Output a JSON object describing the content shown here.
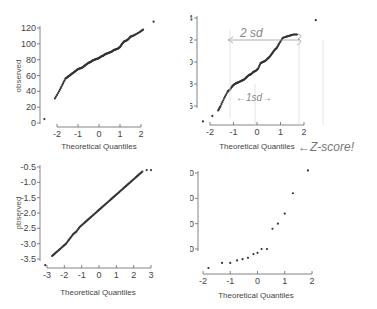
{
  "chart_data": [
    {
      "type": "scatter",
      "panel": "top-left",
      "title": "",
      "xlabel": "Theoretical Quantiles",
      "ylabel": "observed",
      "xticks": [
        "-2",
        "-1",
        "0",
        "1",
        "2"
      ],
      "yticks": [
        "0",
        "20",
        "40",
        "60",
        "80",
        "100",
        "120"
      ],
      "xlim": [
        -2.4,
        2.4
      ],
      "ylim": [
        0,
        120
      ],
      "description": "Q-Q plot, left-skew tail: a few low outliers, then linear body",
      "points": [
        [
          -2.6,
          5
        ],
        [
          -2.1,
          31
        ],
        [
          -1.9,
          40
        ],
        [
          -1.75,
          48
        ],
        [
          -1.6,
          56
        ],
        [
          -1.5,
          58
        ],
        [
          -1.4,
          60
        ],
        [
          -1.3,
          62
        ],
        [
          -1.2,
          64
        ],
        [
          -1.1,
          66
        ],
        [
          -1.0,
          68
        ],
        [
          -0.9,
          69
        ],
        [
          -0.8,
          70
        ],
        [
          -0.7,
          72
        ],
        [
          -0.6,
          74
        ],
        [
          -0.5,
          76
        ],
        [
          -0.4,
          77
        ],
        [
          -0.3,
          79
        ],
        [
          -0.2,
          80
        ],
        [
          -0.1,
          81
        ],
        [
          0.0,
          82
        ],
        [
          0.1,
          84
        ],
        [
          0.2,
          85
        ],
        [
          0.3,
          87
        ],
        [
          0.4,
          88
        ],
        [
          0.5,
          89
        ],
        [
          0.6,
          90
        ],
        [
          0.7,
          92
        ],
        [
          0.8,
          93
        ],
        [
          0.9,
          94
        ],
        [
          1.0,
          96
        ],
        [
          1.1,
          100
        ],
        [
          1.2,
          103
        ],
        [
          1.3,
          104
        ],
        [
          1.4,
          106
        ],
        [
          1.5,
          109
        ],
        [
          1.6,
          110
        ],
        [
          1.75,
          112
        ],
        [
          1.95,
          115
        ],
        [
          2.1,
          118
        ],
        [
          2.6,
          128
        ]
      ]
    },
    {
      "type": "scatter",
      "panel": "top-right",
      "title": "",
      "xlabel": "Theoretical Quantiles",
      "ylabel": "observed",
      "xticks": [
        "-2",
        "-1",
        "0",
        "1",
        "2"
      ],
      "yticks": [
        "6",
        "8",
        "10",
        "12",
        "14"
      ],
      "xlim": [
        -2.2,
        2.2
      ],
      "ylim": [
        5,
        14
      ],
      "annotations": [
        "2 sd",
        "1sd",
        "Z-score!"
      ],
      "points": [
        [
          -2.3,
          4.6
        ],
        [
          -1.9,
          5.1
        ],
        [
          -1.65,
          5.6
        ],
        [
          -1.55,
          6.0
        ],
        [
          -1.4,
          6.7
        ],
        [
          -1.25,
          7.3
        ],
        [
          -1.15,
          7.5
        ],
        [
          -1.05,
          7.8
        ],
        [
          -0.95,
          8.0
        ],
        [
          -0.85,
          8.1
        ],
        [
          -0.75,
          8.2
        ],
        [
          -0.65,
          8.3
        ],
        [
          -0.55,
          8.4
        ],
        [
          -0.45,
          8.6
        ],
        [
          -0.35,
          8.8
        ],
        [
          -0.25,
          8.9
        ],
        [
          -0.15,
          9.1
        ],
        [
          -0.05,
          9.2
        ],
        [
          0.05,
          9.4
        ],
        [
          0.15,
          9.9
        ],
        [
          0.25,
          10.0
        ],
        [
          0.35,
          10.1
        ],
        [
          0.45,
          10.3
        ],
        [
          0.55,
          10.5
        ],
        [
          0.65,
          10.8
        ],
        [
          0.75,
          11.1
        ],
        [
          0.85,
          11.3
        ],
        [
          0.95,
          11.7
        ],
        [
          1.1,
          12.2
        ],
        [
          1.25,
          12.3
        ],
        [
          1.4,
          12.4
        ],
        [
          1.55,
          12.5
        ],
        [
          1.7,
          12.5
        ],
        [
          2.5,
          13.8
        ]
      ]
    },
    {
      "type": "scatter",
      "panel": "bottom-left",
      "title": "",
      "xlabel": "Theoretical Quantiles",
      "ylabel": "observed",
      "xticks": [
        "-3",
        "-2",
        "-1",
        "0",
        "1",
        "2",
        "3"
      ],
      "yticks": [
        "-3.5",
        "-3.0",
        "-2.5",
        "-2.0",
        "-1.5",
        "-1.0",
        "-0.5"
      ],
      "xlim": [
        -3.2,
        3.2
      ],
      "ylim": [
        -3.5,
        -0.5
      ],
      "description": "Q-Q plot, nearly perfectly linear",
      "points": [
        [
          -3.1,
          -3.7
        ],
        [
          -2.7,
          -3.4
        ],
        [
          -2.5,
          -3.3
        ],
        [
          -2.3,
          -3.2
        ],
        [
          -2.1,
          -3.1
        ],
        [
          -1.9,
          -3.0
        ],
        [
          -1.7,
          -2.85
        ],
        [
          -1.5,
          -2.7
        ],
        [
          -1.3,
          -2.6
        ],
        [
          -1.1,
          -2.45
        ],
        [
          -0.9,
          -2.35
        ],
        [
          -0.7,
          -2.25
        ],
        [
          -0.5,
          -2.15
        ],
        [
          -0.3,
          -2.05
        ],
        [
          -0.1,
          -1.95
        ],
        [
          0.1,
          -1.85
        ],
        [
          0.3,
          -1.75
        ],
        [
          0.5,
          -1.65
        ],
        [
          0.7,
          -1.55
        ],
        [
          0.9,
          -1.45
        ],
        [
          1.1,
          -1.35
        ],
        [
          1.3,
          -1.25
        ],
        [
          1.5,
          -1.15
        ],
        [
          1.7,
          -1.05
        ],
        [
          1.9,
          -0.95
        ],
        [
          2.1,
          -0.85
        ],
        [
          2.3,
          -0.75
        ],
        [
          2.5,
          -0.65
        ],
        [
          2.75,
          -0.6
        ],
        [
          3.0,
          -0.6
        ]
      ]
    },
    {
      "type": "scatter",
      "panel": "bottom-right",
      "title": "",
      "xlabel": "Theoretical Quantiles",
      "ylabel": "observed",
      "xticks": [
        "-2",
        "-1",
        "0",
        "1",
        "2"
      ],
      "yticks": [
        "0",
        "20",
        "40",
        "60"
      ],
      "xlim": [
        -2,
        2
      ],
      "ylim": [
        -15,
        60
      ],
      "description": "Q-Q plot, right-skewed with convex curve",
      "points": [
        [
          -1.8,
          -15
        ],
        [
          -1.3,
          -11
        ],
        [
          -1.0,
          -11
        ],
        [
          -0.75,
          -9
        ],
        [
          -0.55,
          -8
        ],
        [
          -0.35,
          -7
        ],
        [
          -0.15,
          -4
        ],
        [
          0.0,
          -3
        ],
        [
          0.15,
          0
        ],
        [
          0.35,
          0
        ],
        [
          0.55,
          16
        ],
        [
          0.75,
          20
        ],
        [
          1.0,
          28
        ],
        [
          1.3,
          44
        ],
        [
          1.85,
          62
        ]
      ]
    }
  ],
  "panels": {
    "top_left": {
      "xlabel": "Theoretical Quantiles",
      "ylabel": "observed"
    },
    "top_right": {
      "xlabel": "Theoretical Quantiles",
      "ylabel": "observed",
      "note_2sd": "2 sd",
      "note_1sd": "←1sd→",
      "note_zscore": "←Z-score!"
    },
    "bottom_left": {
      "xlabel": "Theoretical Quantiles",
      "ylabel": "observed"
    },
    "bottom_right": {
      "xlabel": "Theoretical Quantiles",
      "ylabel": "observed"
    }
  }
}
